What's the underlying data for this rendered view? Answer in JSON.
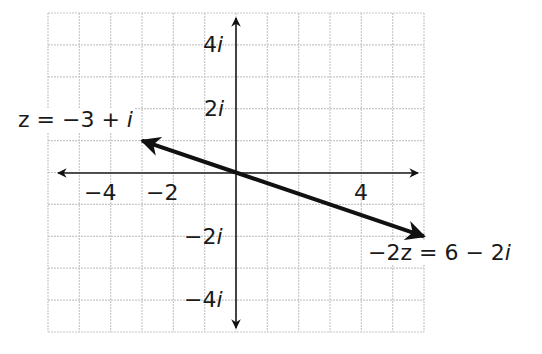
{
  "diagram": {
    "type": "complex-plane",
    "grid": {
      "x_min": -6,
      "x_max": 6,
      "y_min": -5,
      "y_max": 5,
      "step": 1,
      "color": "#c8c8c8"
    },
    "axes": {
      "color": "#1a1a1a"
    },
    "x_ticks": [
      {
        "value": -4,
        "label": "−4"
      },
      {
        "value": -2,
        "label": "−2"
      },
      {
        "value": 4,
        "label": "4"
      }
    ],
    "y_ticks": [
      {
        "value": 4,
        "label": "4i"
      },
      {
        "value": 2,
        "label": "2i"
      },
      {
        "value": -2,
        "label": "−2i"
      },
      {
        "value": -4,
        "label": "−4i"
      }
    ],
    "vectors": [
      {
        "name": "z",
        "from": [
          0,
          0
        ],
        "to": [
          -3,
          1
        ],
        "label_prefix": "z = −3 + ",
        "label_i": "i"
      },
      {
        "name": "-2z",
        "from": [
          0,
          0
        ],
        "to": [
          6,
          -2
        ],
        "label_prefix": "−2z = 6 − 2",
        "label_i": "i"
      }
    ],
    "vector_color": "#111111"
  }
}
